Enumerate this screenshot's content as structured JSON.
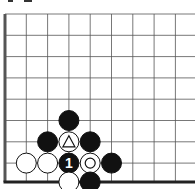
{
  "diagram": {
    "grid": {
      "x0": 5,
      "y0": 14,
      "step": 21.3,
      "cols": 9,
      "rows": 8,
      "edge_left": true,
      "edge_bottom": true
    },
    "stones": [
      {
        "color": "black",
        "col": 3,
        "row": 5
      },
      {
        "color": "black",
        "col": 2,
        "row": 6
      },
      {
        "color": "white",
        "col": 3,
        "row": 6,
        "mark": "triangle"
      },
      {
        "color": "black",
        "col": 4,
        "row": 6
      },
      {
        "color": "white",
        "col": 1,
        "row": 7
      },
      {
        "color": "white",
        "col": 2,
        "row": 7
      },
      {
        "color": "black",
        "col": 3,
        "row": 7,
        "label": "1"
      },
      {
        "color": "white",
        "col": 4,
        "row": 7,
        "mark": "circle"
      },
      {
        "color": "black",
        "col": 5,
        "row": 7
      },
      {
        "color": "white",
        "col": 3,
        "row": 8
      },
      {
        "color": "black",
        "col": 4,
        "row": 8
      }
    ],
    "move_label": "1"
  }
}
